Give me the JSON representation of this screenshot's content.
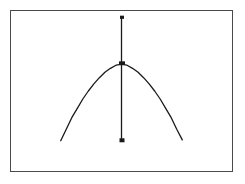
{
  "figure": {
    "background_color": "#ffffff",
    "frame": {
      "border_color": "#4a4a4a",
      "x": 10,
      "y": 10,
      "width": 223,
      "height": 162
    },
    "line_color": "#1a1a1a",
    "marker_color": "#1a1a1a"
  },
  "chart_data": {
    "type": "line",
    "title": "",
    "subtitle": "",
    "xlabel": "",
    "ylabel": "",
    "grid": false,
    "legend": null,
    "xlim": [
      -3,
      3
    ],
    "ylim": [
      -2.4,
      1.2
    ],
    "series": [
      {
        "name": "parabola",
        "description": "downward-opening parabola peaking at x=0",
        "x": [
          -1.65,
          -1.5,
          -1.35,
          -1.2,
          -1.05,
          -0.9,
          -0.75,
          -0.6,
          -0.45,
          -0.3,
          -0.15,
          0,
          0.15,
          0.3,
          0.45,
          0.6,
          0.75,
          0.9,
          1.05,
          1.2,
          1.35,
          1.5,
          1.65
        ],
        "y": [
          -1.72,
          -1.46,
          -1.2,
          -0.99,
          -0.78,
          -0.6,
          -0.44,
          -0.3,
          -0.18,
          -0.09,
          -0.02,
          0,
          -0.02,
          -0.09,
          -0.18,
          -0.3,
          -0.44,
          -0.6,
          -0.78,
          -0.99,
          -1.2,
          -1.46,
          -1.7
        ],
        "style": "solid",
        "color": "#1a1a1a",
        "markers": false
      },
      {
        "name": "vertical-axis-line",
        "description": "vertical line through the peak",
        "x": [
          0,
          0
        ],
        "y": [
          1.05,
          -1.72
        ],
        "style": "solid",
        "color": "#1a1a1a",
        "markers": true
      }
    ],
    "markers": [
      {
        "name": "top-marker",
        "x": 0,
        "y": 1.05,
        "shape": "square"
      },
      {
        "name": "peak-marker",
        "x": 0,
        "y": 0,
        "shape": "square"
      },
      {
        "name": "bottom-marker",
        "x": 0,
        "y": -1.72,
        "shape": "square"
      }
    ],
    "annotations": []
  }
}
